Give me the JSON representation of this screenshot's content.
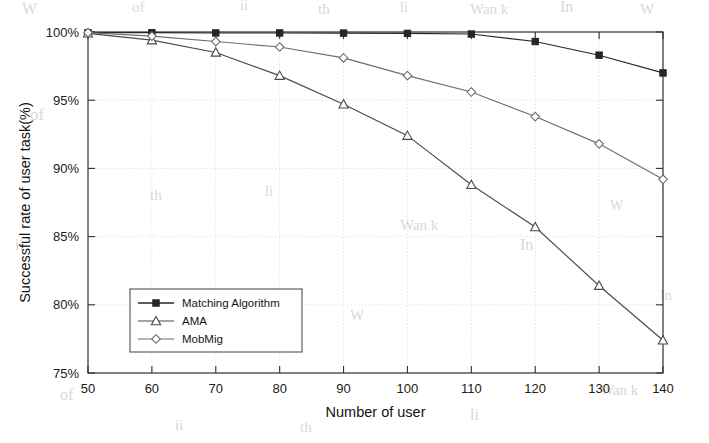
{
  "chart_data": {
    "type": "line",
    "title": "",
    "xlabel": "Number of user",
    "ylabel": "Successful rate of user task(%)",
    "x": [
      50,
      60,
      70,
      80,
      90,
      100,
      110,
      120,
      130,
      140
    ],
    "xlim": [
      50,
      140
    ],
    "ylim": [
      75,
      100
    ],
    "xticks": [
      "50",
      "60",
      "70",
      "80",
      "90",
      "100",
      "110",
      "120",
      "130",
      "140"
    ],
    "yticks": [
      "75%",
      "80%",
      "85%",
      "90%",
      "95%",
      "100%"
    ],
    "ytick_values": [
      75,
      80,
      85,
      90,
      95,
      100
    ],
    "grid": true,
    "legend_position": "lower-left",
    "series": [
      {
        "name": "Matching Algorithm",
        "marker": "filled-square",
        "color": "#262626",
        "values": [
          99.95,
          99.95,
          99.93,
          99.93,
          99.92,
          99.9,
          99.85,
          99.3,
          98.3,
          97.0
        ]
      },
      {
        "name": "AMA",
        "marker": "triangle",
        "color": "#4a4a4a",
        "values": [
          99.9,
          99.4,
          98.5,
          96.8,
          94.7,
          92.4,
          88.8,
          85.7,
          81.4,
          77.4
        ]
      },
      {
        "name": "MobMig",
        "marker": "diamond",
        "color": "#6e6e6e",
        "values": [
          99.95,
          99.7,
          99.3,
          98.9,
          98.1,
          96.8,
          95.6,
          93.8,
          91.8,
          89.2
        ]
      }
    ]
  },
  "artifacts": {
    "scan_marks": [
      "W",
      "of",
      "ii",
      "th",
      "li",
      "Wan k",
      "In"
    ]
  }
}
